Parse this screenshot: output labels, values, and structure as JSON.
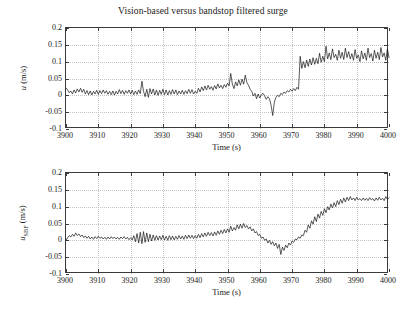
{
  "figure": {
    "title": "Vision-based versus bandstop filtered surge",
    "background": "#ffffff",
    "line_color": "#141414",
    "grid_color": "#c2c2c2"
  },
  "chart_data": [
    {
      "type": "line",
      "title": "Vision-based versus bandstop filtered surge",
      "xlabel": "Time (s)",
      "ylabel": "u (m/s)",
      "ylabel_parts": {
        "symbol": "u",
        "subscript": "",
        "units": "(m/s)"
      },
      "xlim": [
        3900,
        4000
      ],
      "ylim": [
        -0.1,
        0.2
      ],
      "xticks": [
        3900,
        3910,
        3920,
        3930,
        3940,
        3950,
        3960,
        3970,
        3980,
        3990,
        4000
      ],
      "yticks": [
        -0.1,
        -0.05,
        0,
        0.05,
        0.1,
        0.15,
        0.2
      ],
      "xticklabels": [
        "3900",
        "3910",
        "3920",
        "3930",
        "3940",
        "3950",
        "3960",
        "3970",
        "3980",
        "3990",
        "4000"
      ],
      "yticklabels": [
        "-0.1",
        "-0.05",
        "0",
        "0.05",
        "0.1",
        "0.15",
        "0.2"
      ],
      "grid": true,
      "legend": null,
      "series": [
        {
          "name": "u",
          "x": [
            3900,
            3900.5,
            3901,
            3901.5,
            3902,
            3902.5,
            3903,
            3903.5,
            3904,
            3904.5,
            3905,
            3905.5,
            3906,
            3906.5,
            3907,
            3907.5,
            3908,
            3908.5,
            3909,
            3909.5,
            3910,
            3910.5,
            3911,
            3911.5,
            3912,
            3912.5,
            3913,
            3913.5,
            3914,
            3914.5,
            3915,
            3915.5,
            3916,
            3916.5,
            3917,
            3917.5,
            3918,
            3918.5,
            3919,
            3919.5,
            3920,
            3920.5,
            3921,
            3921.5,
            3922,
            3922.5,
            3923,
            3923.5,
            3924,
            3924.5,
            3925,
            3925.5,
            3926,
            3926.5,
            3927,
            3927.5,
            3928,
            3928.5,
            3929,
            3929.5,
            3930,
            3930.5,
            3931,
            3931.5,
            3932,
            3932.5,
            3933,
            3933.5,
            3934,
            3934.5,
            3935,
            3935.5,
            3936,
            3936.5,
            3937,
            3937.5,
            3938,
            3938.5,
            3939,
            3939.5,
            3940,
            3940.5,
            3941,
            3941.5,
            3942,
            3942.5,
            3943,
            3943.5,
            3944,
            3944.5,
            3945,
            3945.5,
            3946,
            3946.5,
            3947,
            3947.5,
            3948,
            3948.5,
            3949,
            3949.5,
            3950,
            3950.5,
            3951,
            3951.5,
            3952,
            3952.5,
            3953,
            3953.5,
            3954,
            3954.5,
            3955,
            3955.5,
            3956,
            3956.5,
            3957,
            3957.5,
            3958,
            3958.5,
            3959,
            3959.5,
            3960,
            3960.5,
            3961,
            3961.5,
            3962,
            3962.5,
            3963,
            3963.5,
            3964,
            3964.5,
            3965,
            3965.5,
            3966,
            3966.5,
            3967,
            3967.5,
            3968,
            3968.5,
            3969,
            3969.5,
            3970,
            3970.5,
            3971,
            3971.5,
            3972,
            3972.5,
            3973,
            3973.5,
            3974,
            3974.5,
            3975,
            3975.5,
            3976,
            3976.5,
            3977,
            3977.5,
            3978,
            3978.5,
            3979,
            3979.5,
            3980,
            3980.5,
            3981,
            3981.5,
            3982,
            3982.5,
            3983,
            3983.5,
            3984,
            3984.5,
            3985,
            3985.5,
            3986,
            3986.5,
            3987,
            3987.5,
            3988,
            3988.5,
            3989,
            3989.5,
            3990,
            3990.5,
            3991,
            3991.5,
            3992,
            3992.5,
            3993,
            3993.5,
            3994,
            3994.5,
            3995,
            3995.5,
            3996,
            3996.5,
            3997,
            3997.5,
            3998,
            3998.5,
            3999,
            3999.5,
            4000
          ],
          "y": [
            0.022,
            0.016,
            0.008,
            0.013,
            0.004,
            0.016,
            0.007,
            0.019,
            0.01,
            0.021,
            0.009,
            0.018,
            0.004,
            0.014,
            0.002,
            0.013,
            0.001,
            0.012,
            0.004,
            0.015,
            0.003,
            0.014,
            0.005,
            0.016,
            0.006,
            0.014,
            0.003,
            0.012,
            0.002,
            0.013,
            0.001,
            0.012,
            0.004,
            0.017,
            0.005,
            0.015,
            0.003,
            0.014,
            0.006,
            0.016,
            0.004,
            0.015,
            0.002,
            0.013,
            0.003,
            0.016,
            0.005,
            0.042,
            0.012,
            -0.004,
            0.018,
            -0.006,
            0.02,
            0.004,
            0.019,
            0.001,
            0.016,
            0.0,
            0.015,
            0.003,
            0.018,
            0.002,
            0.016,
            0.001,
            0.014,
            0.003,
            0.017,
            0.004,
            0.016,
            0.002,
            0.013,
            0.004,
            0.015,
            0.003,
            0.014,
            0.005,
            0.018,
            0.006,
            0.017,
            0.004,
            0.012,
            0.006,
            0.021,
            0.01,
            0.025,
            0.014,
            0.028,
            0.016,
            0.03,
            0.018,
            0.026,
            0.015,
            0.029,
            0.019,
            0.034,
            0.022,
            0.03,
            0.02,
            0.032,
            0.024,
            0.036,
            0.028,
            0.065,
            0.034,
            0.02,
            0.04,
            0.028,
            0.046,
            0.03,
            0.048,
            0.033,
            0.06,
            0.038,
            0.03,
            0.018,
            0.012,
            -0.002,
            0.006,
            -0.01,
            0.004,
            -0.008,
            0.002,
            0.006,
            -0.002,
            -0.012,
            -0.004,
            -0.01,
            -0.03,
            -0.06,
            -0.02,
            -0.006,
            0.0,
            -0.004,
            0.006,
            0.002,
            0.01,
            0.006,
            0.014,
            0.01,
            0.018,
            0.012,
            0.02,
            0.014,
            0.024,
            0.018,
            0.116,
            0.08,
            0.1,
            0.082,
            0.105,
            0.086,
            0.108,
            0.09,
            0.112,
            0.092,
            0.11,
            0.094,
            0.125,
            0.098,
            0.116,
            0.1,
            0.146,
            0.108,
            0.126,
            0.106,
            0.138,
            0.112,
            0.122,
            0.104,
            0.134,
            0.11,
            0.128,
            0.106,
            0.14,
            0.112,
            0.13,
            0.108,
            0.124,
            0.104,
            0.136,
            0.11,
            0.12,
            0.1,
            0.132,
            0.108,
            0.126,
            0.104,
            0.14,
            0.112,
            0.124,
            0.102,
            0.134,
            0.11,
            0.128,
            0.106,
            0.142,
            0.114,
            0.126,
            0.104,
            0.138,
            0.112,
            0.13,
            0.108,
            0.148,
            0.116
          ]
        }
      ]
    },
    {
      "type": "line",
      "title": "",
      "xlabel": "Time (s)",
      "ylabel": "u_SBF (m/s)",
      "ylabel_parts": {
        "symbol": "u",
        "subscript": "SBF",
        "units": "(m/s)"
      },
      "xlim": [
        3900,
        4000
      ],
      "ylim": [
        -0.1,
        0.2
      ],
      "xticks": [
        3900,
        3910,
        3920,
        3930,
        3940,
        3950,
        3960,
        3970,
        3980,
        3990,
        4000
      ],
      "yticks": [
        -0.1,
        -0.05,
        0,
        0.05,
        0.1,
        0.15,
        0.2
      ],
      "xticklabels": [
        "3900",
        "3910",
        "3920",
        "3930",
        "3940",
        "3950",
        "3960",
        "3970",
        "3980",
        "3990",
        "4000"
      ],
      "yticklabels": [
        "-0.1",
        "-0.05",
        "0",
        "0.05",
        "0.1",
        "0.15",
        "0.2"
      ],
      "grid": true,
      "legend": null,
      "series": [
        {
          "name": "u_SBF",
          "x": [
            3900,
            3900.5,
            3901,
            3901.5,
            3902,
            3902.5,
            3903,
            3903.5,
            3904,
            3904.5,
            3905,
            3905.5,
            3906,
            3906.5,
            3907,
            3907.5,
            3908,
            3908.5,
            3909,
            3909.5,
            3910,
            3910.5,
            3911,
            3911.5,
            3912,
            3912.5,
            3913,
            3913.5,
            3914,
            3914.5,
            3915,
            3915.5,
            3916,
            3916.5,
            3917,
            3917.5,
            3918,
            3918.5,
            3919,
            3919.5,
            3920,
            3920.5,
            3921,
            3921.5,
            3922,
            3922.5,
            3923,
            3923.5,
            3924,
            3924.5,
            3925,
            3925.5,
            3926,
            3926.5,
            3927,
            3927.5,
            3928,
            3928.5,
            3929,
            3929.5,
            3930,
            3930.5,
            3931,
            3931.5,
            3932,
            3932.5,
            3933,
            3933.5,
            3934,
            3934.5,
            3935,
            3935.5,
            3936,
            3936.5,
            3937,
            3937.5,
            3938,
            3938.5,
            3939,
            3939.5,
            3940,
            3940.5,
            3941,
            3941.5,
            3942,
            3942.5,
            3943,
            3943.5,
            3944,
            3944.5,
            3945,
            3945.5,
            3946,
            3946.5,
            3947,
            3947.5,
            3948,
            3948.5,
            3949,
            3949.5,
            3950,
            3950.5,
            3951,
            3951.5,
            3952,
            3952.5,
            3953,
            3953.5,
            3954,
            3954.5,
            3955,
            3955.5,
            3956,
            3956.5,
            3957,
            3957.5,
            3958,
            3958.5,
            3959,
            3959.5,
            3960,
            3960.5,
            3961,
            3961.5,
            3962,
            3962.5,
            3963,
            3963.5,
            3964,
            3964.5,
            3965,
            3965.5,
            3966,
            3966.5,
            3967,
            3967.5,
            3968,
            3968.5,
            3969,
            3969.5,
            3970,
            3970.5,
            3971,
            3971.5,
            3972,
            3972.5,
            3973,
            3973.5,
            3974,
            3974.5,
            3975,
            3975.5,
            3976,
            3976.5,
            3977,
            3977.5,
            3978,
            3978.5,
            3979,
            3979.5,
            3980,
            3980.5,
            3981,
            3981.5,
            3982,
            3982.5,
            3983,
            3983.5,
            3984,
            3984.5,
            3985,
            3985.5,
            3986,
            3986.5,
            3987,
            3987.5,
            3988,
            3988.5,
            3989,
            3989.5,
            3990,
            3990.5,
            3991,
            3991.5,
            3992,
            3992.5,
            3993,
            3993.5,
            3994,
            3994.5,
            3995,
            3995.5,
            3996,
            3996.5,
            3997,
            3997.5,
            3998,
            3998.5,
            3999,
            3999.5,
            4000
          ],
          "y": [
            0.0,
            0.008,
            0.014,
            0.01,
            0.018,
            0.012,
            0.022,
            0.014,
            0.019,
            0.011,
            0.016,
            0.008,
            0.013,
            0.006,
            0.012,
            0.004,
            0.01,
            0.003,
            0.011,
            0.005,
            0.012,
            0.006,
            0.01,
            0.004,
            0.009,
            0.003,
            0.01,
            0.004,
            0.011,
            0.005,
            0.01,
            0.004,
            0.009,
            0.003,
            0.01,
            0.005,
            0.011,
            0.004,
            0.009,
            0.002,
            0.008,
            0.001,
            0.014,
            -0.004,
            0.02,
            -0.008,
            0.024,
            -0.01,
            0.026,
            -0.006,
            0.022,
            -0.004,
            0.018,
            -0.002,
            0.016,
            0.0,
            0.014,
            0.001,
            0.013,
            0.002,
            0.015,
            0.001,
            0.012,
            0.0,
            0.014,
            0.002,
            0.013,
            0.001,
            0.012,
            0.003,
            0.014,
            0.004,
            0.013,
            0.003,
            0.015,
            0.005,
            0.016,
            0.006,
            0.015,
            0.005,
            0.014,
            0.006,
            0.018,
            0.008,
            0.02,
            0.01,
            0.022,
            0.012,
            0.024,
            0.014,
            0.023,
            0.013,
            0.025,
            0.015,
            0.028,
            0.018,
            0.03,
            0.02,
            0.032,
            0.022,
            0.034,
            0.024,
            0.042,
            0.028,
            0.038,
            0.03,
            0.046,
            0.034,
            0.048,
            0.036,
            0.05,
            0.038,
            0.044,
            0.034,
            0.04,
            0.028,
            0.034,
            0.022,
            0.026,
            0.014,
            0.018,
            0.006,
            0.01,
            0.0,
            0.004,
            -0.008,
            0.0,
            -0.012,
            -0.004,
            -0.016,
            -0.008,
            -0.024,
            -0.012,
            -0.042,
            -0.02,
            -0.03,
            -0.014,
            -0.022,
            -0.008,
            -0.014,
            -0.002,
            -0.006,
            0.004,
            0.002,
            0.01,
            0.006,
            0.016,
            0.014,
            0.03,
            0.024,
            0.046,
            0.036,
            0.058,
            0.048,
            0.07,
            0.056,
            0.078,
            0.066,
            0.086,
            0.074,
            0.094,
            0.082,
            0.1,
            0.09,
            0.108,
            0.096,
            0.112,
            0.1,
            0.118,
            0.106,
            0.122,
            0.11,
            0.126,
            0.114,
            0.128,
            0.118,
            0.13,
            0.12,
            0.126,
            0.118,
            0.128,
            0.12,
            0.124,
            0.118,
            0.126,
            0.119,
            0.125,
            0.118,
            0.127,
            0.12,
            0.124,
            0.117,
            0.126,
            0.119,
            0.128,
            0.12,
            0.125,
            0.118,
            0.13,
            0.122,
            0.126,
            0.118,
            0.132,
            0.122,
            0.128,
            0.104
          ]
        }
      ]
    }
  ]
}
